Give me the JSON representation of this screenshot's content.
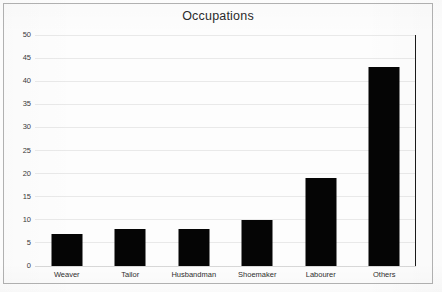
{
  "chart_data": {
    "type": "bar",
    "title": "Occupations",
    "xlabel": "",
    "ylabel": "",
    "categories": [
      "Weaver",
      "Tailor",
      "Husbandman",
      "Shoemaker",
      "Labourer",
      "Others"
    ],
    "values": [
      7,
      8,
      8,
      10,
      19,
      43
    ],
    "ylim": [
      0,
      50
    ],
    "ytick_step": 5,
    "yticks": [
      0,
      5,
      10,
      15,
      20,
      25,
      30,
      35,
      40,
      45,
      50
    ],
    "ytick_labels": [
      "0",
      "5",
      "10",
      "15",
      "20",
      "25",
      "30",
      "35",
      "40",
      "45",
      "50"
    ],
    "grid": true,
    "grid_axis": "y",
    "legend": false,
    "legend_position": "none",
    "bar_color": "#050505",
    "grid_color": "#e9e9e9",
    "frame_color": "#b3b3b3",
    "axis_color": "#1a1a1a",
    "background_color": "#fdfdfd",
    "text_color": "#2b2b2b"
  }
}
